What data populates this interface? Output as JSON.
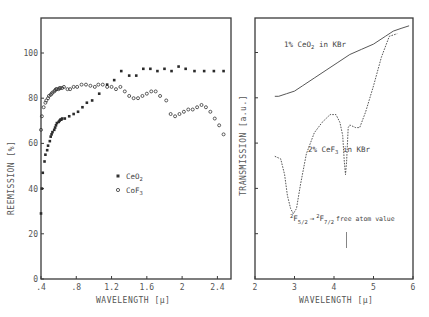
{
  "chart_data": [
    {
      "type": "scatter",
      "panel": "left",
      "title": "",
      "xlabel": "WAVELENGTH [μ]",
      "ylabel": "REEMISSION [%]",
      "xlim": [
        0.4,
        2.55
      ],
      "ylim": [
        0,
        115
      ],
      "x_ticks": [
        ".4",
        ".8",
        "1.2",
        "1.6",
        "2",
        "2.4"
      ],
      "x_tick_values": [
        0.4,
        0.8,
        1.2,
        1.6,
        2.0,
        2.4
      ],
      "y_ticks": [
        "0",
        "20",
        "40",
        "60",
        "80",
        "100"
      ],
      "y_tick_values": [
        0,
        20,
        40,
        60,
        80,
        100
      ],
      "grid": false,
      "legend": [
        {
          "label": "CeO",
          "sub": "2",
          "marker": "filled-square"
        },
        {
          "label": "CoF",
          "sub": "3",
          "marker": "open-circle"
        }
      ],
      "series": [
        {
          "name": "CeO2",
          "marker": "filled-square",
          "x": [
            0.4,
            0.41,
            0.42,
            0.44,
            0.45,
            0.47,
            0.48,
            0.5,
            0.51,
            0.52,
            0.53,
            0.55,
            0.56,
            0.57,
            0.58,
            0.6,
            0.61,
            0.62,
            0.63,
            0.64,
            0.67,
            0.72,
            0.77,
            0.82,
            0.87,
            0.92,
            0.98,
            1.06,
            1.15,
            1.23,
            1.31,
            1.4,
            1.48,
            1.56,
            1.64,
            1.72,
            1.8,
            1.88,
            1.96,
            2.04,
            2.14,
            2.25,
            2.36,
            2.47
          ],
          "y": [
            29,
            40,
            47,
            52,
            55,
            57,
            59,
            61,
            63,
            64,
            65,
            66,
            67,
            68,
            69,
            69.5,
            70,
            70.5,
            70.5,
            71,
            71,
            72,
            73,
            74,
            76,
            78,
            79,
            82,
            86,
            88,
            92,
            90,
            90,
            93,
            93,
            92,
            93,
            92,
            94,
            93,
            92,
            92,
            92,
            92
          ]
        },
        {
          "name": "CoF3",
          "marker": "open-circle",
          "x": [
            0.4,
            0.41,
            0.43,
            0.45,
            0.46,
            0.48,
            0.49,
            0.51,
            0.52,
            0.53,
            0.55,
            0.56,
            0.57,
            0.58,
            0.6,
            0.61,
            0.62,
            0.64,
            0.66,
            0.7,
            0.73,
            0.77,
            0.81,
            0.86,
            0.91,
            0.96,
            1.01,
            1.05,
            1.1,
            1.15,
            1.2,
            1.25,
            1.3,
            1.35,
            1.4,
            1.45,
            1.5,
            1.55,
            1.6,
            1.65,
            1.7,
            1.75,
            1.82,
            1.87,
            1.92,
            1.97,
            2.02,
            2.07,
            2.12,
            2.17,
            2.22,
            2.27,
            2.32,
            2.37,
            2.42,
            2.47
          ],
          "y": [
            66,
            72,
            76,
            78,
            79,
            80,
            81,
            81.5,
            82,
            82.5,
            83,
            83.5,
            84,
            84,
            84,
            84.5,
            84.5,
            84.5,
            85,
            84,
            84,
            85,
            85,
            86,
            86,
            85.5,
            85,
            86,
            86,
            85,
            85,
            84,
            85,
            83,
            81,
            80,
            80,
            81,
            82,
            83,
            83,
            81,
            79,
            73,
            72,
            73,
            74,
            75,
            75,
            76,
            77,
            76,
            74,
            71,
            68,
            64
          ]
        }
      ]
    },
    {
      "type": "line",
      "panel": "right",
      "title": "",
      "xlabel": "WAVELENGTH [μ]",
      "ylabel": "TRANSMISSION [a.u.]",
      "xlim": [
        2,
        6
      ],
      "x_ticks": [
        "2",
        "3",
        "4",
        "5",
        "6"
      ],
      "x_tick_values": [
        2,
        3,
        4,
        5,
        6
      ],
      "y_ticks_unlabeled": 6,
      "grid": false,
      "series": [
        {
          "name": "1% CeO2 in KBr",
          "style": "solid",
          "x": [
            2.5,
            2.6,
            2.8,
            3.0,
            3.2,
            3.5,
            3.8,
            4.1,
            4.4,
            4.7,
            5.0,
            5.3,
            5.5,
            5.7,
            5.9
          ],
          "y_norm": [
            0.7,
            0.7,
            0.71,
            0.72,
            0.74,
            0.77,
            0.8,
            0.83,
            0.86,
            0.88,
            0.9,
            0.93,
            0.95,
            0.96,
            0.97
          ]
        },
        {
          "name": "2% CeF3 in KBr",
          "style": "dashed",
          "x": [
            2.5,
            2.65,
            2.75,
            2.82,
            2.9,
            2.97,
            3.05,
            3.15,
            3.3,
            3.5,
            3.7,
            3.9,
            4.05,
            4.15,
            4.22,
            4.26,
            4.29,
            4.32,
            4.36,
            4.4,
            4.55,
            4.65,
            4.8,
            5.0,
            5.2,
            5.4,
            5.6
          ],
          "y_norm": [
            0.47,
            0.46,
            0.4,
            0.32,
            0.27,
            0.25,
            0.27,
            0.36,
            0.48,
            0.56,
            0.6,
            0.63,
            0.63,
            0.6,
            0.55,
            0.45,
            0.4,
            0.45,
            0.58,
            0.59,
            0.58,
            0.58,
            0.64,
            0.74,
            0.85,
            0.93,
            0.94
          ]
        }
      ],
      "annotations": [
        {
          "text": "1% CeO₂ in KBr",
          "x": 2.95,
          "y_norm": 0.89
        },
        {
          "text": "2% CeF₃ in KBr",
          "x": 3.35,
          "y_norm": 0.47
        },
        {
          "text": "²F5/2 → ²F7/2",
          "x": 2.9,
          "y_norm": 0.22
        },
        {
          "text": "free atom value",
          "x": 4.0,
          "y_norm": 0.22
        },
        {
          "text": "marker line",
          "x": 4.3,
          "y_norm_range": [
            0.13,
            0.18
          ]
        }
      ]
    }
  ],
  "left_panel": {
    "ylabel": "REEMISSION [%]",
    "xlabel": "WAVELENGTH [μ]",
    "x_ticks": [
      ".4",
      ".8",
      "1.2",
      "1.6",
      "2",
      "2.4"
    ],
    "y_ticks": [
      "0",
      "20",
      "40",
      "60",
      "80",
      "100"
    ],
    "legend": {
      "ceo2": "CeO",
      "ceo2_sub": "2",
      "cof3": "CoF",
      "cof3_sub": "3"
    }
  },
  "right_panel": {
    "ylabel": "TRANSMISSION [a.u.]",
    "xlabel": "WAVELENGTH [μ]",
    "x_ticks": [
      "2",
      "3",
      "4",
      "5",
      "6"
    ],
    "label_ceo2": "1% CeO",
    "label_ceo2_sub": "2",
    "label_ceo2_tail": " in KBr",
    "label_cef3": "2% CeF",
    "label_cef3_sub": "3",
    "label_cef3_tail": " in KBr",
    "transition_from": "F",
    "transition_from_sub": "5/2",
    "transition_to": "F",
    "transition_to_sub": "7/2",
    "transition_sup": "2",
    "transition_arrow": "→",
    "free_atom": "free atom value"
  }
}
